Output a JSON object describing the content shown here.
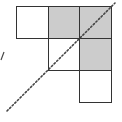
{
  "diagram": {
    "cells": [
      {
        "row": 0,
        "col": 0,
        "shaded": false,
        "x": 16,
        "y": 6
      },
      {
        "row": 0,
        "col": 1,
        "shaded": true,
        "x": 48,
        "y": 6
      },
      {
        "row": 0,
        "col": 2,
        "shaded": true,
        "x": 79,
        "y": 6
      },
      {
        "row": 1,
        "col": 1,
        "shaded": false,
        "x": 48,
        "y": 38
      },
      {
        "row": 1,
        "col": 2,
        "shaded": true,
        "x": 79,
        "y": 38
      },
      {
        "row": 2,
        "col": 2,
        "shaded": false,
        "x": 79,
        "y": 70
      }
    ],
    "cell_size": 32,
    "colors": {
      "border": "#333333",
      "shaded": "#cccccc",
      "unshaded": "#ffffff",
      "dotted_line": "#444444"
    },
    "diagonal": {
      "x1": 7,
      "y1": 111,
      "x2": 115,
      "y2": 3,
      "style": "dotted"
    },
    "tick": {
      "x1": 1,
      "y1": 60,
      "x2": 4,
      "y2": 52
    }
  }
}
